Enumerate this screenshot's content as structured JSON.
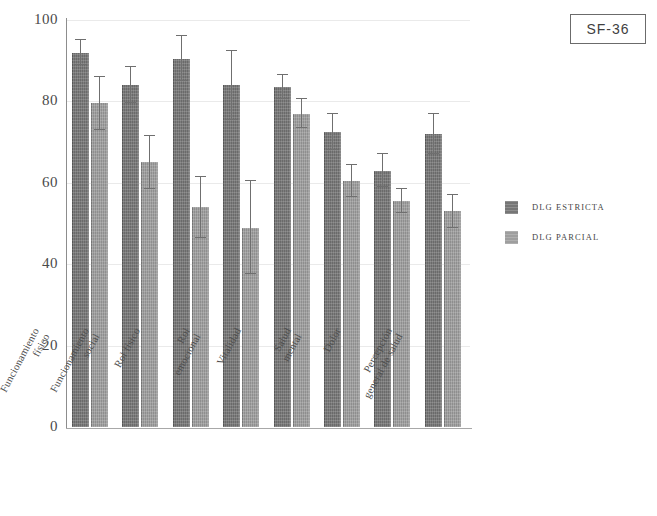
{
  "title_badge": "SF-36",
  "legend": {
    "position": "right",
    "entries": [
      {
        "label": "DLG ESTRICTA",
        "color": "#767676"
      },
      {
        "label": "DLG PARCIAL",
        "color": "#9e9e9e"
      }
    ]
  },
  "axis": {
    "y_ticks": [
      "100",
      "80",
      "60",
      "40",
      "20",
      "0"
    ]
  },
  "categories_display": [
    "Funcionamiento\nfísico",
    "Funcionamiento\nsocial",
    "Rol físico",
    "Rol\nemocional",
    "Vitalidad",
    "Salud\nmental",
    "Dolor",
    "Percepción\ngeneral de salud"
  ],
  "chart_data": {
    "type": "bar",
    "title": "SF-36",
    "xlabel": "",
    "ylabel": "",
    "ylim": [
      0,
      100
    ],
    "yticks": [
      0,
      20,
      40,
      60,
      80,
      100
    ],
    "grid": true,
    "legend_position": "right",
    "categories": [
      "Funcionamiento físico",
      "Funcionamiento social",
      "Rol físico",
      "Rol emocional",
      "Vitalidad",
      "Salud mental",
      "Dolor",
      "Percepción general de salud"
    ],
    "series": [
      {
        "name": "DLG ESTRICTA",
        "color": "#767676",
        "values": [
          92,
          84,
          90.5,
          84,
          83.5,
          72.5,
          63,
          72
        ],
        "errors_upper": [
          95,
          88.5,
          96,
          92.5,
          86.5,
          77,
          67,
          77
        ],
        "errors_lower": [
          89,
          79.5,
          85,
          75.5,
          80.5,
          68,
          59,
          67
        ]
      },
      {
        "name": "DLG PARCIAL",
        "color": "#9e9e9e",
        "values": [
          79.5,
          65,
          54,
          49,
          77,
          60.5,
          55.5,
          53
        ],
        "errors_upper": [
          86,
          71.5,
          61.5,
          60.5,
          80.5,
          64.5,
          58.5,
          57
        ],
        "errors_lower": [
          73,
          58.5,
          46.5,
          37.5,
          73.5,
          56.5,
          52.5,
          49
        ]
      }
    ]
  }
}
